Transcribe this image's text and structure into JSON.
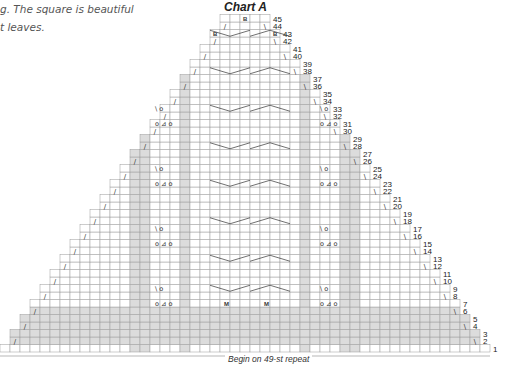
{
  "intro": {
    "line1": "g. The square is beautiful",
    "line2": "t leaves."
  },
  "chart": {
    "title": "Chart A",
    "footer": "Begin on 49-st repeat",
    "rows": 45,
    "row_labels_right": [
      "1",
      "2",
      "3",
      "4",
      "5",
      "6",
      "7",
      "8",
      "9",
      "10",
      "11",
      "12",
      "13",
      "14",
      "15",
      "16",
      "17",
      "18",
      "19",
      "20",
      "21",
      "22",
      "23",
      "24",
      "25",
      "26",
      "27",
      "28",
      "29",
      "30",
      "31",
      "32",
      "33",
      "34",
      "35",
      "36",
      "37",
      "38",
      "39",
      "40",
      "41",
      "42",
      "43",
      "44",
      "45"
    ],
    "symbols": {
      "k2tog": "/",
      "ssk": "\\",
      "yo": "o",
      "double_dec": "triangle",
      "bobble": "B",
      "make1": "M"
    },
    "colors": {
      "grid": "#9a9a9a",
      "shade": "#dcdcdc",
      "ink": "#333333"
    }
  }
}
